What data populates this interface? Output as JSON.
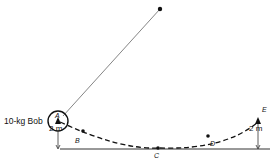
{
  "diagram": {
    "bob_label": "10-kg Bob",
    "points": {
      "A": "A",
      "B": "B",
      "C": "C",
      "D": "D",
      "E": "E"
    },
    "height_left": "2 m",
    "height_right": "2 m"
  }
}
